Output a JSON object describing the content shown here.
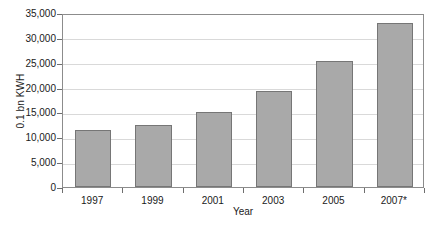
{
  "chart_data": {
    "type": "bar",
    "title": "",
    "subtitle": "",
    "xlabel": "Year",
    "ylabel": "0.1 bn KWH",
    "categories": [
      "1997",
      "1999",
      "2001",
      "2003",
      "2005",
      "2007*"
    ],
    "values": [
      11400,
      12500,
      15000,
      19400,
      25300,
      33000
    ],
    "series": [
      {
        "name": "Electricity",
        "values": [
          11400,
          12500,
          15000,
          19400,
          25300,
          33000
        ]
      }
    ],
    "ylim": [
      0,
      35000
    ],
    "ytick_values": [
      0,
      5000,
      10000,
      15000,
      20000,
      25000,
      30000,
      35000
    ],
    "ytick_labels": [
      "0",
      "5,000",
      "10,000",
      "15,000",
      "20,000",
      "25,000",
      "30,000",
      "35,000"
    ],
    "grid": "horizontal",
    "legend": "none",
    "annotations": [
      "*"
    ],
    "colors": {
      "bar_fill": "#a9a9a9",
      "bar_edge": "#767676",
      "gridline": "#d9d9d9",
      "axis": "#8c8c8c",
      "text": "#1a1a1a",
      "background": "#ffffff"
    }
  },
  "footnote": {
    "clipped_text": ""
  }
}
